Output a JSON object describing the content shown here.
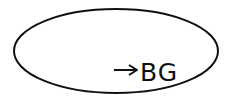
{
  "diagram": {
    "shape": "ellipse",
    "stroke_color": "#111111",
    "fill_color": "#ffffff",
    "label": {
      "arrow": "→",
      "text": "BG"
    }
  }
}
